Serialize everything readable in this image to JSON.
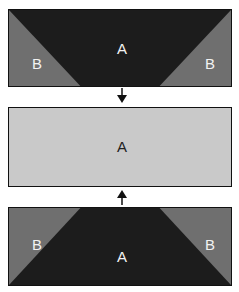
{
  "colors": {
    "region_a_dark": "#1c1c1c",
    "region_b": "#6f6f6f",
    "region_a_light": "#c9c9c9",
    "border": "#111111",
    "arrow": "#111111"
  },
  "diagram": {
    "top_panel": {
      "shape": "inverted trapezoid A between two triangles B",
      "labels": {
        "center": "A",
        "left": "B",
        "right": "B"
      }
    },
    "arrow_down": {
      "direction": "down"
    },
    "middle_panel": {
      "shape": "full rectangle A",
      "labels": {
        "center": "A"
      }
    },
    "arrow_up": {
      "direction": "up"
    },
    "bottom_panel": {
      "shape": "trapezoid A between two triangles B",
      "labels": {
        "center": "A",
        "left": "B",
        "right": "B"
      }
    }
  }
}
